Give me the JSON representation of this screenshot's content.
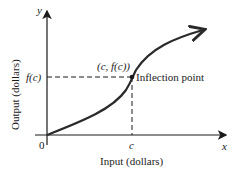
{
  "diagram": {
    "axes": {
      "y_label": "y",
      "x_label": "x",
      "origin_label": "0",
      "y_axis_title": "Output (dollars)",
      "x_axis_title": "Input (dollars)"
    },
    "point": {
      "coord_label": "(c, f(c))",
      "annotation": "Inflection point",
      "x_tick_label": "c",
      "y_tick_label": "f(c)"
    },
    "colors": {
      "ink": "#1a1a1a",
      "curve": "#2a2a2a",
      "background": "#ffffff"
    }
  }
}
